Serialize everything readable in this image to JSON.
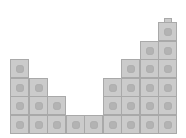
{
  "diagram": {
    "type": "snap-cube-columns",
    "column_heights": [
      4,
      3,
      2,
      1,
      1,
      3,
      4,
      5,
      6
    ],
    "colors": {
      "cube_fill": "#cbcbcb",
      "cube_border": "#a9a9a9",
      "dot": "#b3b3b3",
      "background": "#ffffff"
    },
    "nub_on_column": 8
  }
}
